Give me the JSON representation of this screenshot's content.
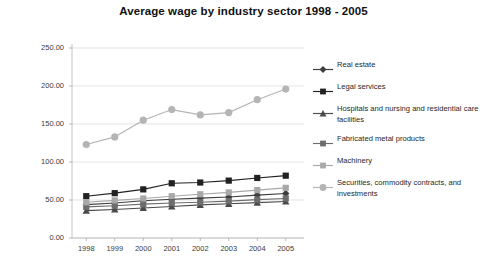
{
  "chart_data": {
    "type": "line",
    "title": "Average wage by industry sector 1998 - 2005",
    "xlabel": "",
    "ylabel": "Thousands of Dollars",
    "categories": [
      "1998",
      "1999",
      "2000",
      "2001",
      "2002",
      "2003",
      "2004",
      "2005"
    ],
    "x_tick_labels": [
      "1998",
      "1999",
      "2000",
      "2001",
      "2002",
      "2003",
      "2004",
      "2005"
    ],
    "y_tick_labels": [
      "0.00",
      "50.00",
      "100.00",
      "150.00",
      "200.00",
      "250.00"
    ],
    "y_tick_values": [
      0,
      50,
      100,
      150,
      200,
      250
    ],
    "ylim": [
      0,
      250
    ],
    "grid": true,
    "legend_position": "right",
    "series": [
      {
        "name": "Real estate",
        "marker": "diamond",
        "color": "#3f3f3f",
        "values": [
          44.0,
          46.0,
          49.0,
          51.0,
          52.5,
          54.0,
          56.5,
          58.5
        ]
      },
      {
        "name": "Legal services",
        "marker": "square",
        "color": "#222222",
        "values": [
          55.0,
          59.0,
          64.0,
          72.0,
          73.0,
          75.5,
          79.0,
          82.0
        ]
      },
      {
        "name": "Hospitals and nursing and residential care facilities",
        "marker": "triangle",
        "color": "#4a4a4a",
        "values": [
          36.0,
          37.5,
          39.5,
          41.5,
          43.5,
          45.0,
          46.5,
          48.0
        ]
      },
      {
        "name": "Fabricated metal products",
        "marker": "square",
        "color": "#6d6d6d",
        "values": [
          41.0,
          42.5,
          44.5,
          46.0,
          47.0,
          48.5,
          50.5,
          52.0
        ]
      },
      {
        "name": "Machinery",
        "marker": "square",
        "color": "#a8a8a8",
        "values": [
          47.0,
          49.5,
          52.0,
          55.0,
          57.5,
          60.0,
          63.0,
          66.0
        ]
      },
      {
        "name": "Securities, commodity contracts, and investments",
        "marker": "circle",
        "color": "#b4b4b4",
        "values": [
          123.0,
          133.0,
          155.0,
          169.0,
          162.0,
          165.0,
          182.0,
          196.0
        ]
      }
    ]
  },
  "legend": {
    "items": [
      {
        "label": "Real estate"
      },
      {
        "label": "Legal services"
      },
      {
        "label": "Hospitals and nursing and residential care facilities"
      },
      {
        "label": "Fabricated metal products"
      },
      {
        "label": "Machinery"
      },
      {
        "label": "Securities, commodity contracts, and investments"
      }
    ]
  }
}
